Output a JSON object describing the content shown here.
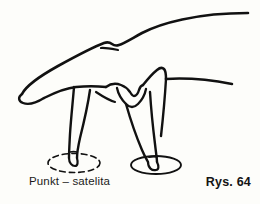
{
  "figure": {
    "kind": "line-drawing",
    "background_color": "#fdfdfa",
    "ink_color": "#111111",
    "caption": "Punkt – satelita",
    "figure_number": "Rys. 64",
    "markers": [
      {
        "name": "satellite-point-marker",
        "style": "dashed-ellipse",
        "cx": 74,
        "cy": 163,
        "rx": 26,
        "ry": 9.5,
        "labelled_by": "Punkt – satelita"
      },
      {
        "name": "contact-point-marker",
        "style": "solid-ellipse",
        "cx": 156,
        "cy": 165,
        "rx": 25,
        "ry": 9
      }
    ],
    "fingers": [
      {
        "name": "index-finger-touching",
        "tip_x": 72,
        "tip_y": 162
      },
      {
        "name": "middle-finger-touching",
        "tip_x": 158,
        "tip_y": 164
      }
    ]
  }
}
